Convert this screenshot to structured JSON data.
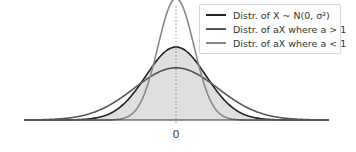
{
  "chart_data": {
    "type": "line",
    "title": "",
    "xlabel": "",
    "ylabel": "",
    "x_ticks": [
      "0"
    ],
    "grid": false,
    "legend_position": "upper right",
    "series": [
      {
        "name": "Distr. of X ~ N(0, σ²)",
        "color": "#222222",
        "sigma": 1.0,
        "filled": true
      },
      {
        "name": "Distr. of aX where a > 1",
        "color": "#555555",
        "sigma": 1.4
      },
      {
        "name": "Distr. of aX where a < 1",
        "color": "#888888",
        "sigma": 0.6
      }
    ],
    "vertical_reference_line": {
      "x": 0,
      "style": "dotted"
    }
  },
  "legend": {
    "items": [
      {
        "label": "Distr. of X ~ N(0, σ²)",
        "color": "#222222"
      },
      {
        "label": "Distr. of aX where a > 1",
        "color": "#555555"
      },
      {
        "label": "Distr. of aX where a < 1",
        "color": "#888888"
      }
    ]
  },
  "axis": {
    "tick_zero": "0"
  }
}
